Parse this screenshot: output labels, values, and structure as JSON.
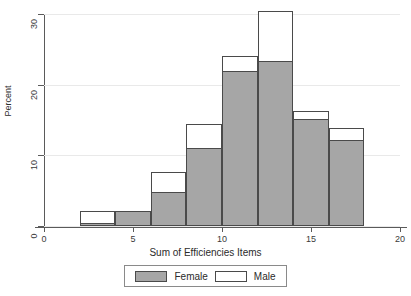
{
  "chart_data": {
    "type": "bar",
    "title": "",
    "subtitle": "",
    "xlabel": "Sum of Efficiencies Items",
    "ylabel": "Percent",
    "xlim": [
      0,
      20
    ],
    "ylim": [
      0,
      30
    ],
    "xticks": [
      0,
      5,
      10,
      15,
      20
    ],
    "yticks": [
      0,
      10,
      20,
      30
    ],
    "xtick_labels": [
      "0",
      "5",
      "10",
      "15",
      "20"
    ],
    "ytick_labels": [
      "0",
      "10",
      "20",
      "30"
    ],
    "grid": "horizontal",
    "legend_position": "bottom",
    "bin_width": 2,
    "bin_edges": [
      2,
      4,
      6,
      8,
      10,
      12,
      14,
      16,
      18
    ],
    "categories": [
      "2-4",
      "4-6",
      "6-8",
      "8-10",
      "10-12",
      "12-14",
      "14-16",
      "16-18"
    ],
    "series": [
      {
        "name": "Male",
        "style": "outline",
        "color": "#ffffff",
        "edge_color": "#4a4a4a",
        "values": [
          2.1,
          2.1,
          7.7,
          14.5,
          24.0,
          30.4,
          16.3,
          13.8
        ]
      },
      {
        "name": "Female",
        "style": "filled",
        "color": "#a6a6a6",
        "edge_color": "#4a4a4a",
        "values": [
          0.4,
          2.1,
          4.8,
          11.0,
          21.9,
          23.4,
          15.2,
          12.2
        ]
      }
    ]
  },
  "legend": {
    "items": [
      {
        "label": "Female",
        "swatch": "filled-gray"
      },
      {
        "label": "Male",
        "swatch": "outline-white"
      }
    ]
  }
}
